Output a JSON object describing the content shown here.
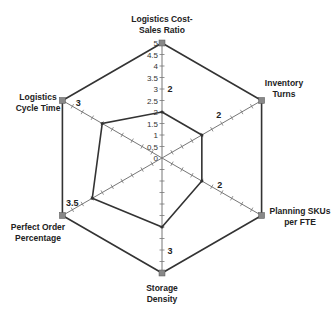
{
  "chart_data": {
    "type": "radar",
    "title": "",
    "axes": [
      "Logistics Cost-Sales Ratio",
      "Inventory Turns",
      "Planning SKUs per FTE",
      "Storage Density",
      "Perfect Order Percentage",
      "Logistics Cycle Time"
    ],
    "axis_label_lines": [
      [
        "Logistics Cost-",
        "Sales Ratio"
      ],
      [
        "Inventory",
        "Turns"
      ],
      [
        "Planning SKUs",
        "per FTE"
      ],
      [
        "Storage",
        "Density"
      ],
      [
        "Perfect Order",
        "Percentage"
      ],
      [
        "Logistics",
        "Cycle Time"
      ]
    ],
    "series": [
      {
        "name": "Current",
        "values": [
          2,
          2,
          2,
          3,
          3.5,
          3
        ]
      },
      {
        "name": "Max",
        "values": [
          5,
          5,
          5,
          5,
          5,
          5
        ]
      }
    ],
    "value_labels": [
      "2",
      "2",
      "2",
      "3",
      "3.5",
      "3"
    ],
    "range": [
      0,
      5
    ],
    "tick_step": 0.5,
    "tick_labels": [
      "0",
      "0.5",
      "1",
      "1.5",
      "2",
      "2.5",
      "3",
      "3.5",
      "4",
      "4.5",
      "5"
    ],
    "grid": false,
    "legend": "none",
    "colors": {
      "line": "#333333",
      "axis": "#777777",
      "marker": "#888888"
    }
  }
}
